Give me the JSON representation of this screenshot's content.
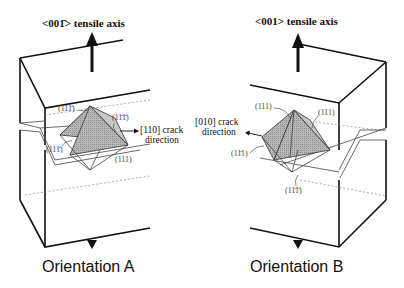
{
  "figure": {
    "panels": [
      {
        "id": "A",
        "axis_label": "<001̄> tensile axis",
        "crack_label_line1": "[110] crack",
        "crack_label_line2": "direction",
        "plane_labels": [
          "(111̄)",
          "(11̄1̄)",
          "(111̄)",
          "(111)"
        ],
        "caption": "Orientation A"
      },
      {
        "id": "B",
        "axis_label": "<001> tensile axis",
        "crack_label_line1": "[010] crack",
        "crack_label_line2": "direction",
        "plane_labels": [
          "(111)",
          "(111)",
          "(11̄1)",
          "(11̄1̄)"
        ],
        "caption": "Orientation B"
      }
    ]
  }
}
